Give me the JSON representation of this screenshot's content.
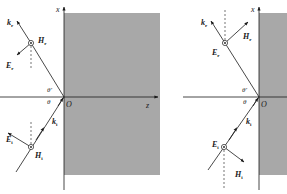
{
  "colors": {
    "medium": "#a8a8a8",
    "ink": "#1a1a1a",
    "background": "#ffffff"
  },
  "left_panel": {
    "case": "H perpendicular to plane of incidence",
    "axis_x_label": "x",
    "axis_z_label": "z",
    "origin_label": "O",
    "theta_label": "θ",
    "theta_prime_label": "θ'",
    "reflected": {
      "k": {
        "main": "k",
        "sub": "r"
      },
      "H": {
        "main": "H",
        "sub": "r"
      },
      "E": {
        "main": "E",
        "sub": "r"
      }
    },
    "incident": {
      "k": {
        "main": "k",
        "sub": "i"
      },
      "H": {
        "main": "H",
        "sub": "i"
      },
      "E": {
        "main": "E",
        "sub": "i"
      }
    }
  },
  "right_panel": {
    "case": "E perpendicular to plane of incidence",
    "axis_x_label": "x",
    "origin_label": "O",
    "theta_label": "θ",
    "theta_prime_label": "θ'",
    "reflected": {
      "k": {
        "main": "k",
        "sub": "r"
      },
      "H": {
        "main": "H",
        "sub": "r"
      },
      "E": {
        "main": "E",
        "sub": "r"
      }
    },
    "incident": {
      "k": {
        "main": "k",
        "sub": "i"
      },
      "H": {
        "main": "H",
        "sub": "i"
      },
      "E": {
        "main": "E",
        "sub": "i"
      }
    }
  }
}
